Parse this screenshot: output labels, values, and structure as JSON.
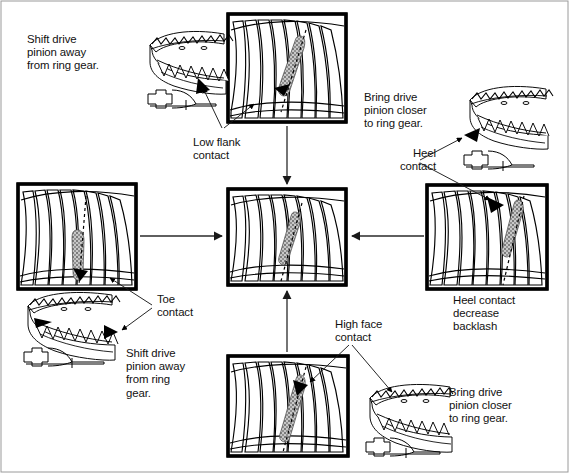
{
  "diagram": {
    "background_color": "#ffffff",
    "line_color": "#000000",
    "pattern_fill_color": "#bdbdbd",
    "frame_border_color": "#000000"
  },
  "labels": {
    "top_left_instruction": "Shift drive\npinion away\nfrom ring gear.",
    "low_flank_contact": "Low flank\ncontact",
    "top_right_instruction": "Bring drive\npinion closer\nto ring gear.",
    "heel_contact": "Heel\ncontact",
    "heel_contact_backlash": "Heel contact\ndecrease\nbacklash",
    "toe_contact": "Toe\ncontact",
    "bottom_left_instruction": "Shift drive\npinion away\nfrom ring\ngear.",
    "high_face_contact": "High face\ncontact",
    "bottom_right_instruction": "Bring drive\npinion closer\nto ring gear."
  },
  "panels": [
    {
      "id": "panel-top",
      "name": "low-flank-contact-pattern",
      "contact_location": "low flank",
      "pattern_position": "upper-center, angled down-left",
      "x": 228,
      "y": 14,
      "w": 118,
      "h": 108
    },
    {
      "id": "panel-left",
      "name": "toe-contact-pattern",
      "contact_location": "toe",
      "pattern_position": "lower-center",
      "x": 18,
      "y": 184,
      "w": 118,
      "h": 105
    },
    {
      "id": "panel-center",
      "name": "correct-contact-pattern",
      "contact_location": "correct / centered",
      "pattern_position": "center",
      "x": 228,
      "y": 189,
      "w": 118,
      "h": 96
    },
    {
      "id": "panel-right",
      "name": "heel-contact-pattern",
      "contact_location": "heel",
      "pattern_position": "right side",
      "x": 427,
      "y": 185,
      "w": 120,
      "h": 104
    },
    {
      "id": "panel-bottom",
      "name": "high-face-contact-pattern",
      "contact_location": "high face",
      "pattern_position": "upper-center",
      "x": 228,
      "y": 356,
      "w": 120,
      "h": 100
    }
  ],
  "gear_figures": [
    {
      "id": "gear-top-left",
      "name": "ring-gear-toe-side-view",
      "x": 143,
      "y": 30,
      "w": 86,
      "h": 80
    },
    {
      "id": "gear-top-right",
      "name": "ring-gear-heel-side-view",
      "x": 460,
      "y": 75,
      "w": 92,
      "h": 80
    },
    {
      "id": "gear-bottom-left",
      "name": "ring-gear-toe-adjust-view",
      "x": 20,
      "y": 295,
      "w": 105,
      "h": 80
    },
    {
      "id": "gear-bottom-right",
      "name": "ring-gear-high-face-view",
      "x": 362,
      "y": 372,
      "w": 100,
      "h": 80
    }
  ],
  "arrows": [
    {
      "name": "arrow-left-to-center",
      "from": "panel-left",
      "to": "panel-center",
      "direction": "right"
    },
    {
      "name": "arrow-right-to-center",
      "from": "panel-right",
      "to": "panel-center",
      "direction": "left"
    },
    {
      "name": "arrow-top-to-center",
      "from": "panel-top",
      "to": "panel-center",
      "direction": "down"
    },
    {
      "name": "arrow-bottom-to-center",
      "from": "panel-bottom",
      "to": "panel-center",
      "direction": "up"
    }
  ]
}
